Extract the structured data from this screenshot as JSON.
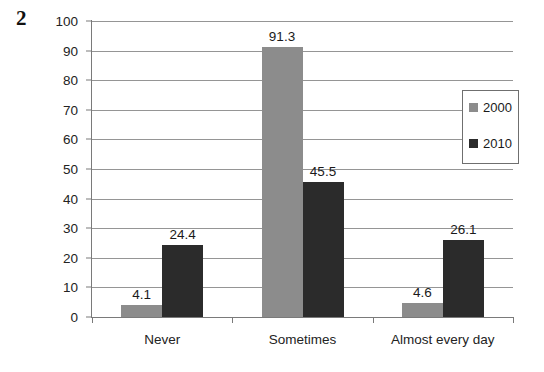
{
  "figure": {
    "number": "2"
  },
  "chart_data": {
    "type": "bar",
    "title": "",
    "xlabel": "",
    "ylabel": "",
    "ylim": [
      0,
      100
    ],
    "y_ticks": [
      "0",
      "10",
      "20",
      "30",
      "40",
      "50",
      "60",
      "70",
      "80",
      "90",
      "100"
    ],
    "grid": true,
    "legend_position": "top-right-inside",
    "categories": [
      "Never",
      "Sometimes",
      "Almost every day"
    ],
    "series": [
      {
        "name": "2000",
        "color": "#8c8c8c",
        "values": [
          4.1,
          91.3,
          4.6
        ],
        "labels": [
          "4.1",
          "91.3",
          "4.6"
        ]
      },
      {
        "name": "2010",
        "color": "#2b2b2b",
        "values": [
          24.4,
          45.5,
          26.1
        ],
        "labels": [
          "24.4",
          "45.5",
          "26.1"
        ]
      }
    ]
  },
  "legend": {
    "entries": [
      {
        "label": "2000",
        "color": "#8c8c8c"
      },
      {
        "label": "2010",
        "color": "#2b2b2b"
      }
    ]
  }
}
